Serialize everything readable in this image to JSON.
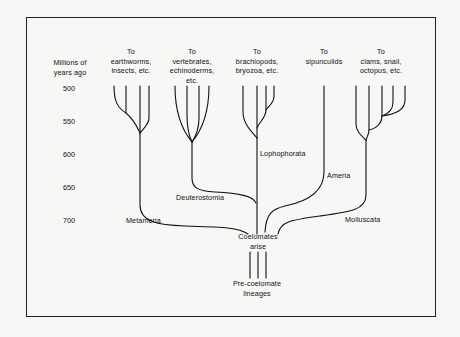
{
  "axis": {
    "title_line1": "Millions of",
    "title_line2": "years ago",
    "ticks": [
      "500",
      "550",
      "600",
      "650",
      "700"
    ]
  },
  "destinations": [
    {
      "line1": "To",
      "line2": "earthworms,",
      "line3": "insects, etc."
    },
    {
      "line1": "To",
      "line2": "vertebrates,",
      "line3": "echinoderms,",
      "line4": "etc."
    },
    {
      "line1": "To",
      "line2": "brachiopods,",
      "line3": "bryozoa, etc."
    },
    {
      "line1": "To",
      "line2": "sipunculids"
    },
    {
      "line1": "To",
      "line2": "clams, snail,",
      "line3": "octopus, etc."
    }
  ],
  "clades": {
    "metameria": "Metameria",
    "deuterostomia": "Deuterostomia",
    "lophophorata": "Lophophorata",
    "ameria": "Ameria",
    "molluscata": "Molluscata"
  },
  "origin": {
    "line1": "Coelomates",
    "line2": "arise"
  },
  "base": {
    "line1": "Pre-coelomate",
    "line2": "lineages"
  },
  "colors": {
    "background": "#f7f7f5",
    "ink": "#111111"
  }
}
